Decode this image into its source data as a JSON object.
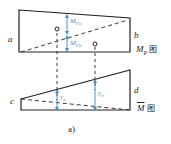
{
  "diagram": {
    "top_figure": {
      "left_label": "a",
      "right_label": "b",
      "upper_moment_label": "M",
      "upper_moment_sub": "Pa",
      "lower_moment_label": "M",
      "lower_moment_sub": "Pb",
      "caption_main": "M",
      "caption_sub": "P",
      "caption_suffix": "图"
    },
    "bottom_figure": {
      "left_label": "c",
      "right_label": "d",
      "ordinate_a_label": "y",
      "ordinate_a_sub": "a",
      "ordinate_b_label": "y",
      "ordinate_b_sub": "b",
      "caption_main": "M",
      "caption_suffix": "图"
    },
    "figure_caption": "a)"
  },
  "colors": {
    "line": "#222222",
    "accent": "#4a90c8"
  }
}
